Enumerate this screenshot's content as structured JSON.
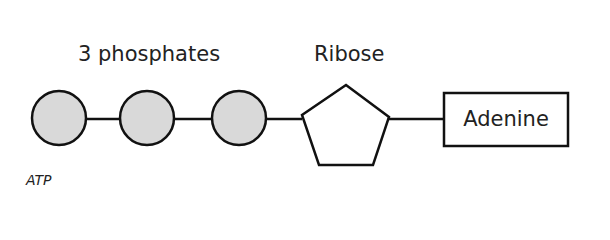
{
  "diagram": {
    "title_caption": "ATP",
    "labels": {
      "phosphates": "3 phosphates",
      "ribose": "Ribose",
      "adenine": "Adenine"
    },
    "nodes": [
      {
        "id": "phosphate-1",
        "shape": "circle",
        "fill": "#d9d9d9"
      },
      {
        "id": "phosphate-2",
        "shape": "circle",
        "fill": "#d9d9d9"
      },
      {
        "id": "phosphate-3",
        "shape": "circle",
        "fill": "#d9d9d9"
      },
      {
        "id": "ribose",
        "shape": "pentagon",
        "fill": "#ffffff"
      },
      {
        "id": "adenine",
        "shape": "rectangle",
        "fill": "#ffffff"
      }
    ],
    "edges": [
      [
        "phosphate-1",
        "phosphate-2"
      ],
      [
        "phosphate-2",
        "phosphate-3"
      ],
      [
        "phosphate-3",
        "ribose"
      ],
      [
        "ribose",
        "adenine"
      ]
    ],
    "colors": {
      "stroke": "#111111",
      "phosphate_fill": "#d9d9d9",
      "text": "#222222"
    }
  }
}
